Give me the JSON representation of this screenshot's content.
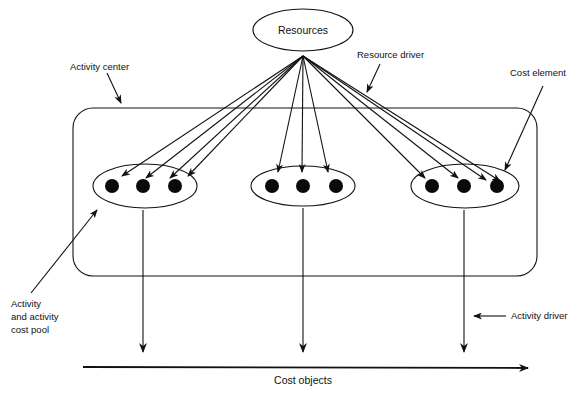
{
  "diagram": {
    "resources": {
      "label": "Resources"
    },
    "labels": {
      "activity_center": "Activity center",
      "resource_driver": "Resource driver",
      "cost_element": "Cost element",
      "activity_pool_line1": "Activity",
      "activity_pool_line2": "and activity",
      "activity_pool_line3": "cost pool",
      "activity_driver": "Activity driver",
      "cost_objects": "Cost objects"
    },
    "activity_pools": [
      {
        "name": "pool-left",
        "cost_elements": 3
      },
      {
        "name": "pool-middle",
        "cost_elements": 3
      },
      {
        "name": "pool-right",
        "cost_elements": 3
      }
    ],
    "colors": {
      "ink": "#111111",
      "background": "#ffffff"
    }
  }
}
